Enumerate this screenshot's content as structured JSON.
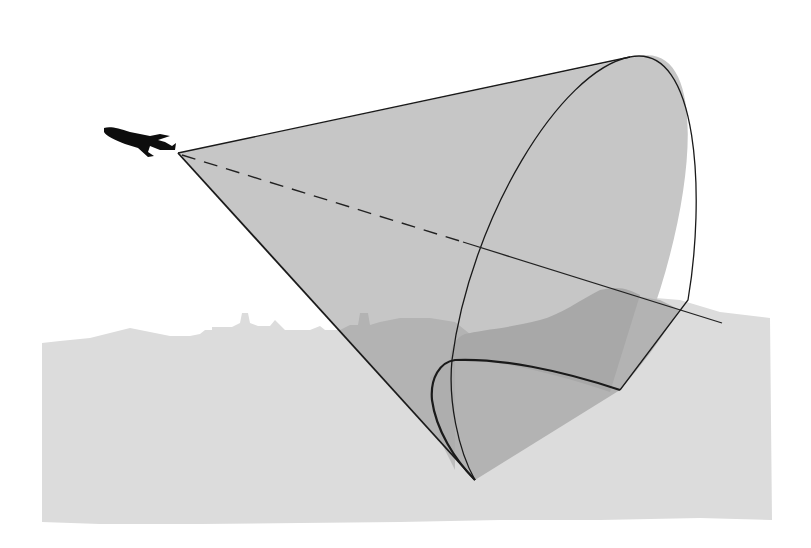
{
  "diagram": {
    "elements": [
      {
        "id": "aircraft",
        "icon": "airplane-icon",
        "description": "Black jet aircraft silhouette flying toward upper-left"
      },
      {
        "id": "beam-cone",
        "description": "Grey conical beam emanating from aircraft apex"
      },
      {
        "id": "beam-axis",
        "description": "Dashed centerline inside cone, solid line beyond cone"
      },
      {
        "id": "ground",
        "description": "Light grey ground band with city skyline silhouette"
      },
      {
        "id": "footprint",
        "description": "Darker grey footprint where cone intersects ground"
      }
    ],
    "colors": {
      "background": "#ffffff",
      "ground": "#dcdcdc",
      "cone": "#c8c8c8",
      "footprint": "#a9a9a9",
      "skyline_in_cone": "#b4b4b4",
      "outline": "#1a1a1a",
      "aircraft": "#0d0d0d"
    }
  }
}
